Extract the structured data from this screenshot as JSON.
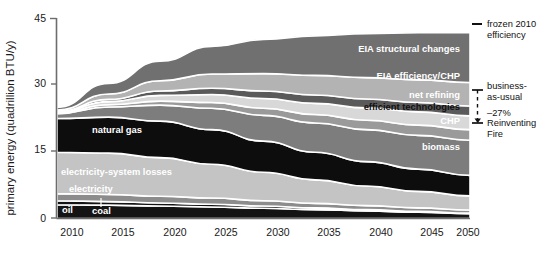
{
  "chart_data": {
    "type": "area",
    "title": "",
    "subtitle": "",
    "xlabel": "",
    "ylabel": "primary energy (quadrillion BTU/y)",
    "xlim": [
      2010,
      2050
    ],
    "ylim": [
      0,
      45
    ],
    "ytick_labels": [
      "0",
      "15",
      "30",
      "45"
    ],
    "yticks": [
      0,
      15,
      30,
      45
    ],
    "xtick_labels": [
      "2010",
      "2015",
      "2020",
      "2025",
      "2030",
      "2035",
      "2040",
      "2045",
      "2050"
    ],
    "xticks": [
      2010,
      2015,
      2020,
      2025,
      2030,
      2035,
      2040,
      2045,
      2050
    ],
    "grid": false,
    "legend_position": "right",
    "x": [
      2010,
      2015,
      2020,
      2025,
      2030,
      2035,
      2040,
      2045,
      2050
    ],
    "stack_order_bottom_to_top": [
      "oil",
      "coal",
      "electricity",
      "electricity-system losses",
      "natural gas",
      "biomass",
      "CHP",
      "efficient technologies",
      "net refining",
      "EIA efficiency/CHP",
      "EIA structural changes"
    ],
    "series": [
      {
        "name": "oil",
        "color": "#141414",
        "values": [
          3.1,
          3.0,
          2.8,
          2.6,
          2.3,
          2.0,
          1.7,
          1.4,
          1.1
        ]
      },
      {
        "name": "coal",
        "color": "#141414",
        "values": [
          0.9,
          0.8,
          0.7,
          0.6,
          0.5,
          0.4,
          0.3,
          0.2,
          0.1
        ]
      },
      {
        "name": "electricity",
        "color": "#8c8c8c",
        "values": [
          1.6,
          1.6,
          1.5,
          1.4,
          1.2,
          1.0,
          0.9,
          0.8,
          0.7
        ]
      },
      {
        "name": "electricity-system losses",
        "color": "#c4c4c4",
        "values": [
          9.3,
          9.3,
          8.7,
          7.6,
          6.4,
          5.3,
          4.4,
          3.7,
          3.2
        ]
      },
      {
        "name": "natural gas",
        "color": "#0d0d0d",
        "values": [
          7.6,
          8.1,
          8.2,
          7.8,
          7.0,
          6.2,
          5.5,
          5.0,
          4.6
        ]
      },
      {
        "name": "biomass",
        "color": "#7d7d7d",
        "values": [
          1.1,
          2.3,
          3.6,
          4.8,
          5.8,
          6.6,
          7.2,
          7.6,
          7.9
        ]
      },
      {
        "name": "CHP",
        "color": "#9a9a9a",
        "values": [
          0.2,
          0.5,
          0.9,
          1.3,
          1.6,
          1.9,
          2.1,
          2.3,
          2.4
        ]
      },
      {
        "name": "efficient technologies",
        "color": "#d8d8d8",
        "values": [
          0.2,
          0.7,
          1.3,
          1.8,
          2.2,
          2.5,
          2.8,
          3.0,
          3.1
        ]
      },
      {
        "name": "net refining",
        "color": "#5a5a5a",
        "values": [
          0.1,
          0.5,
          1.0,
          1.4,
          1.7,
          1.9,
          2.0,
          2.1,
          2.2
        ]
      },
      {
        "name": "EIA efficiency/CHP",
        "color": "#b3b3b3",
        "values": [
          0.3,
          1.2,
          2.3,
          3.2,
          3.9,
          4.4,
          4.8,
          5.1,
          5.3
        ]
      },
      {
        "name": "EIA structural changes",
        "color": "#707070",
        "values": [
          0.6,
          2.4,
          4.4,
          6.2,
          7.7,
          8.9,
          9.9,
          10.6,
          11.2
        ]
      }
    ],
    "annotations": [
      {
        "label": "oil",
        "style": "dark-band-light-text"
      },
      {
        "label": "coal",
        "style": "dark-band-light-text-with-leader"
      },
      {
        "label": "electricity",
        "style": "mid-band-light-text"
      },
      {
        "label": "electricity-system losses",
        "style": "light-band-white-text"
      },
      {
        "label": "natural gas",
        "style": "dark-band-light-text"
      },
      {
        "label": "biomass",
        "style": "mid-band-light-text"
      },
      {
        "label": "CHP",
        "style": "mid-band-light-text"
      },
      {
        "label": "efficient technologies",
        "style": "light-band-dark-text"
      },
      {
        "label": "net refining",
        "style": "dark-band-light-text"
      },
      {
        "label": "EIA efficiency/CHP",
        "style": "light-band-white-text"
      },
      {
        "label": "EIA structural changes",
        "style": "mid-band-light-text"
      }
    ]
  },
  "axis": {
    "y_title": "primary energy (quadrillion BTU/y)",
    "y_ticks": [
      "45",
      "30",
      "15",
      "0"
    ],
    "x_ticks": [
      "2010",
      "2015",
      "2020",
      "2025",
      "2030",
      "2035",
      "2040",
      "2045",
      "2050"
    ]
  },
  "band_labels": {
    "eia_structural_changes": "EIA structural changes",
    "eia_efficiency_chp": "EIA efficiency/CHP",
    "net_refining": "net refining",
    "efficient_technologies": "efficient technologies",
    "chp": "CHP",
    "biomass": "biomass",
    "natural_gas": "natural gas",
    "electricity_system_losses": "electricity-system losses",
    "electricity": "electricity",
    "oil": "oil",
    "coal": "coal"
  },
  "legend": {
    "frozen": {
      "line1": "frozen 2010",
      "line2": "efficiency"
    },
    "bau": {
      "line1": "business-",
      "line2": "as-usual"
    },
    "delta": "–27%",
    "reinventing": {
      "line1": "Reinventing",
      "line2": "Fire"
    }
  },
  "colors": {
    "eia_structural_changes": "#707070",
    "eia_efficiency_chp": "#b3b3b3",
    "net_refining": "#5a5a5a",
    "efficient_technologies": "#d8d8d8",
    "chp": "#9a9a9a",
    "biomass": "#7d7d7d",
    "natural_gas": "#0d0d0d",
    "electricity_system_losses": "#c4c4c4",
    "electricity": "#8c8c8c",
    "oil": "#141414",
    "coal": "#141414",
    "axis": "#6d6d6d",
    "text": "#1a1a1a"
  }
}
